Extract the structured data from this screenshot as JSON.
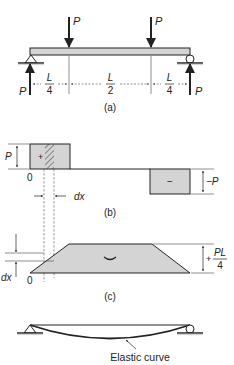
{
  "figure_a": {
    "load_left": "P",
    "load_right": "P",
    "reaction_left": "P",
    "reaction_right": "P",
    "dim_left_num": "L",
    "dim_left_den": "4",
    "dim_mid_num": "L",
    "dim_mid_den": "2",
    "dim_right_num": "L",
    "dim_right_den": "4",
    "caption": "(a)"
  },
  "figure_b": {
    "left_magnitude": "P",
    "origin": "0",
    "positive_sign": "+",
    "negative_sign": "−",
    "right_magnitude": "−P",
    "strip_width": "dx",
    "caption": "(b)"
  },
  "figure_c": {
    "strip_label": "dx",
    "origin": "0",
    "sign": "+",
    "max_num": "PL",
    "max_den": "4",
    "curvature_glyph": "‿",
    "caption": "(c)"
  },
  "figure_d": {
    "curve_label": "Elastic curve"
  },
  "colors": {
    "fill_gray": "#d4d4d4",
    "line": "#222222",
    "shadow": "#666666"
  }
}
